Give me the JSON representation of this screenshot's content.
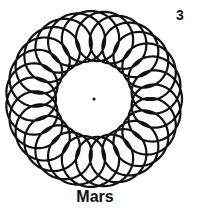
{
  "figure": {
    "number": "3",
    "planet_label": "Mars",
    "pattern": {
      "center": [
        94,
        99
      ],
      "deferent_radius": 63,
      "epicycle_radius": 25,
      "loops": 27,
      "stroke_color": "#111111",
      "stroke_width": 2.2,
      "center_dot_radius": 1.6
    }
  }
}
